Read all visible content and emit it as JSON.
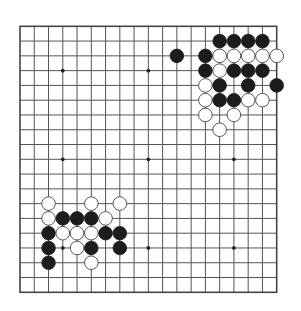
{
  "game": {
    "type": "go",
    "board_size": 19,
    "colors": {
      "background": "#ffffff",
      "line": "#555555",
      "border": "#444444",
      "black_stone": "#1c1c1c",
      "white_stone": "#ffffff",
      "white_outline": "#444444"
    },
    "star_points": [
      [
        3,
        3
      ],
      [
        9,
        3
      ],
      [
        15,
        3
      ],
      [
        3,
        9
      ],
      [
        9,
        9
      ],
      [
        15,
        9
      ],
      [
        3,
        15
      ],
      [
        9,
        15
      ],
      [
        15,
        15
      ]
    ],
    "stones": [
      {
        "color": "black",
        "col": 14,
        "row": 1
      },
      {
        "color": "black",
        "col": 15,
        "row": 1
      },
      {
        "color": "black",
        "col": 16,
        "row": 1
      },
      {
        "color": "black",
        "col": 17,
        "row": 1
      },
      {
        "color": "black",
        "col": 11,
        "row": 2
      },
      {
        "color": "black",
        "col": 13,
        "row": 2
      },
      {
        "color": "white",
        "col": 14,
        "row": 2
      },
      {
        "color": "white",
        "col": 15,
        "row": 2
      },
      {
        "color": "white",
        "col": 16,
        "row": 2
      },
      {
        "color": "white",
        "col": 17,
        "row": 2
      },
      {
        "color": "white",
        "col": 18,
        "row": 2
      },
      {
        "color": "black",
        "col": 13,
        "row": 3
      },
      {
        "color": "white",
        "col": 14,
        "row": 3
      },
      {
        "color": "black",
        "col": 15,
        "row": 3
      },
      {
        "color": "black",
        "col": 16,
        "row": 3
      },
      {
        "color": "black",
        "col": 17,
        "row": 3
      },
      {
        "color": "white",
        "col": 13,
        "row": 4
      },
      {
        "color": "black",
        "col": 14,
        "row": 4
      },
      {
        "color": "black",
        "col": 16,
        "row": 4
      },
      {
        "color": "black",
        "col": 18,
        "row": 4
      },
      {
        "color": "white",
        "col": 13,
        "row": 5
      },
      {
        "color": "black",
        "col": 14,
        "row": 5
      },
      {
        "color": "black",
        "col": 15,
        "row": 5
      },
      {
        "color": "white",
        "col": 16,
        "row": 5
      },
      {
        "color": "white",
        "col": 17,
        "row": 5
      },
      {
        "color": "white",
        "col": 13,
        "row": 6
      },
      {
        "color": "white",
        "col": 15,
        "row": 6
      },
      {
        "color": "white",
        "col": 14,
        "row": 7
      },
      {
        "color": "white",
        "col": 2,
        "row": 12
      },
      {
        "color": "white",
        "col": 5,
        "row": 12
      },
      {
        "color": "white",
        "col": 7,
        "row": 12
      },
      {
        "color": "white",
        "col": 2,
        "row": 13
      },
      {
        "color": "black",
        "col": 3,
        "row": 13
      },
      {
        "color": "black",
        "col": 4,
        "row": 13
      },
      {
        "color": "black",
        "col": 5,
        "row": 13
      },
      {
        "color": "white",
        "col": 6,
        "row": 13
      },
      {
        "color": "black",
        "col": 2,
        "row": 14
      },
      {
        "color": "white",
        "col": 3,
        "row": 14
      },
      {
        "color": "white",
        "col": 4,
        "row": 14
      },
      {
        "color": "white",
        "col": 5,
        "row": 14
      },
      {
        "color": "black",
        "col": 6,
        "row": 14
      },
      {
        "color": "black",
        "col": 7,
        "row": 14
      },
      {
        "color": "black",
        "col": 2,
        "row": 15
      },
      {
        "color": "white",
        "col": 4,
        "row": 15
      },
      {
        "color": "black",
        "col": 5,
        "row": 15
      },
      {
        "color": "black",
        "col": 7,
        "row": 15
      },
      {
        "color": "black",
        "col": 2,
        "row": 16
      },
      {
        "color": "white",
        "col": 5,
        "row": 16
      }
    ]
  }
}
